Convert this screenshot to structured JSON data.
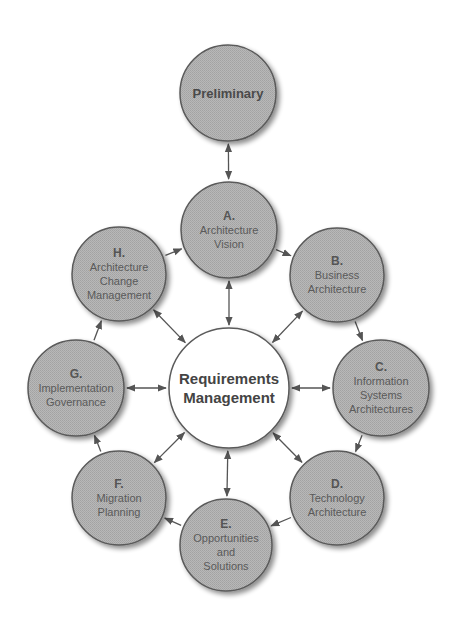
{
  "diagram": {
    "type": "TOGAF ADM cycle",
    "colors": {
      "node_fill": "#b3b3b3",
      "node_border": "#5a5a5a",
      "center_fill": "#ffffff",
      "arrow": "#555555",
      "text": "#4a4a4a"
    },
    "preliminary": {
      "label": "Preliminary",
      "cx": 228,
      "cy": 93,
      "r": 48
    },
    "center": {
      "line1": "Requirements",
      "line2": "Management",
      "cx": 229,
      "cy": 388,
      "r": 60
    },
    "phases": [
      {
        "id": "A",
        "letter": "A.",
        "lines": [
          "Architecture",
          "Vision"
        ],
        "cx": 229,
        "cy": 230,
        "r": 48
      },
      {
        "id": "B",
        "letter": "B.",
        "lines": [
          "Business",
          "Architecture"
        ],
        "cx": 337,
        "cy": 275,
        "r": 47
      },
      {
        "id": "C",
        "letter": "C.",
        "lines": [
          "Information",
          "Systems",
          "Architectures"
        ],
        "cx": 381,
        "cy": 388,
        "r": 48
      },
      {
        "id": "D",
        "letter": "D.",
        "lines": [
          "Technology",
          "Architecture"
        ],
        "cx": 337,
        "cy": 498,
        "r": 47
      },
      {
        "id": "E",
        "letter": "E.",
        "lines": [
          "Opportunities",
          "and",
          "Solutions"
        ],
        "cx": 226,
        "cy": 545,
        "r": 46
      },
      {
        "id": "F",
        "letter": "F.",
        "lines": [
          "Migration",
          "Planning"
        ],
        "cx": 119,
        "cy": 498,
        "r": 47
      },
      {
        "id": "G",
        "letter": "G.",
        "lines": [
          "Implementation",
          "Governance"
        ],
        "cx": 76,
        "cy": 388,
        "r": 48
      },
      {
        "id": "H",
        "letter": "H.",
        "lines": [
          "Architecture",
          "Change",
          "Management"
        ],
        "cx": 119,
        "cy": 274,
        "r": 47
      }
    ],
    "edges": [
      {
        "from": "Preliminary",
        "to": "A",
        "style": "bidirectional"
      },
      {
        "from": "A",
        "to": "B",
        "style": "directed"
      },
      {
        "from": "B",
        "to": "C",
        "style": "directed"
      },
      {
        "from": "C",
        "to": "D",
        "style": "directed"
      },
      {
        "from": "D",
        "to": "E",
        "style": "directed"
      },
      {
        "from": "E",
        "to": "F",
        "style": "directed"
      },
      {
        "from": "F",
        "to": "G",
        "style": "directed"
      },
      {
        "from": "G",
        "to": "H",
        "style": "directed"
      },
      {
        "from": "H",
        "to": "A",
        "style": "directed"
      },
      {
        "from": "A",
        "to": "Requirements Management",
        "style": "bidirectional"
      },
      {
        "from": "B",
        "to": "Requirements Management",
        "style": "bidirectional"
      },
      {
        "from": "C",
        "to": "Requirements Management",
        "style": "bidirectional"
      },
      {
        "from": "D",
        "to": "Requirements Management",
        "style": "bidirectional"
      },
      {
        "from": "E",
        "to": "Requirements Management",
        "style": "bidirectional"
      },
      {
        "from": "F",
        "to": "Requirements Management",
        "style": "bidirectional"
      },
      {
        "from": "G",
        "to": "Requirements Management",
        "style": "bidirectional"
      },
      {
        "from": "H",
        "to": "Requirements Management",
        "style": "bidirectional"
      }
    ]
  }
}
